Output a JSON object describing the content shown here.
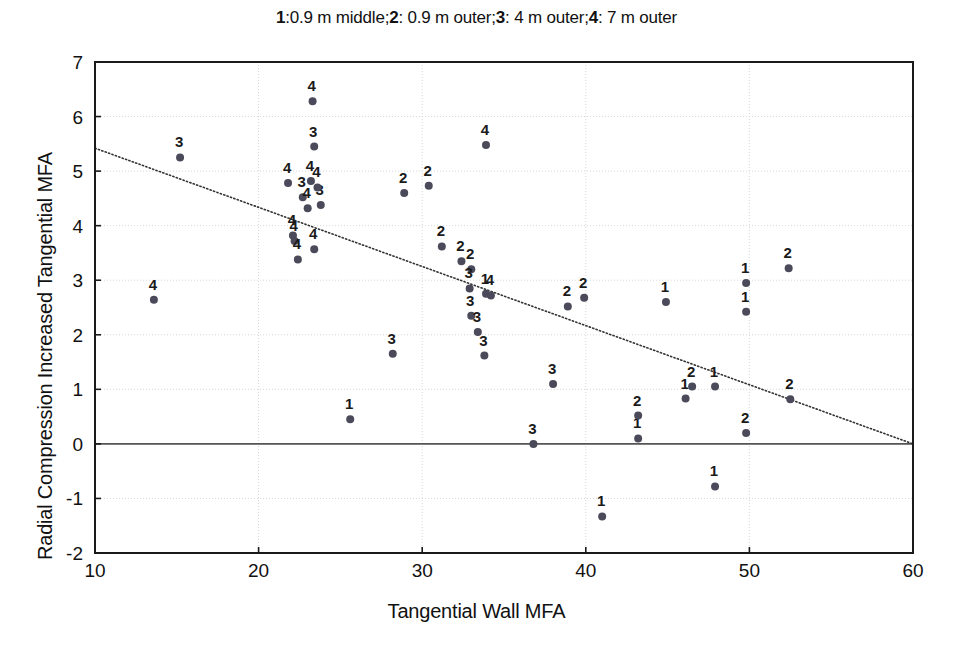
{
  "chart_data": {
    "type": "scatter",
    "title": "1:0.9 m middle;2: 0.9 m outer;3: 4 m outer;4: 7 m outer",
    "title_parts": [
      {
        "text": "1",
        "bold": true
      },
      {
        "text": ":0.9 m middle;",
        "bold": false
      },
      {
        "text": "2",
        "bold": true
      },
      {
        "text": ": 0.9 m outer;",
        "bold": false
      },
      {
        "text": "3",
        "bold": true
      },
      {
        "text": ": 4 m outer;",
        "bold": false
      },
      {
        "text": "4",
        "bold": true
      },
      {
        "text": ": 7 m outer",
        "bold": false
      }
    ],
    "xlabel": "Tangential Wall MFA",
    "ylabel": "Radial Compression Increased Tangential MFA",
    "xlim": [
      10,
      60
    ],
    "ylim": [
      -2,
      7
    ],
    "xticks": [
      10,
      20,
      30,
      40,
      50,
      60
    ],
    "yticks": [
      -2,
      -1,
      0,
      1,
      2,
      3,
      4,
      5,
      6,
      7
    ],
    "grid": true,
    "grid_style": "dotted-light",
    "legend": "none",
    "marker_color": "#4a4a5a",
    "marker_size": 4,
    "label_position": "above-left",
    "zero_line": {
      "y": 0,
      "color": "#555555",
      "width": 1.6
    },
    "trend_line": {
      "style": "dotted",
      "color": "#333333",
      "x0": 10,
      "y0": 5.42,
      "x1": 60,
      "y1": 0.0
    },
    "series": [
      {
        "name": "1",
        "label": "1: 0.9 m middle",
        "points": [
          {
            "x": 25.6,
            "y": 0.45
          },
          {
            "x": 33.9,
            "y": 2.75
          },
          {
            "x": 41.0,
            "y": -1.33
          },
          {
            "x": 43.2,
            "y": 0.1
          },
          {
            "x": 44.9,
            "y": 2.6
          },
          {
            "x": 46.1,
            "y": 0.83
          },
          {
            "x": 47.9,
            "y": 1.05
          },
          {
            "x": 47.9,
            "y": -0.78
          },
          {
            "x": 49.8,
            "y": 2.95
          },
          {
            "x": 49.8,
            "y": 2.42
          }
        ]
      },
      {
        "name": "2",
        "label": "2: 0.9 m outer",
        "points": [
          {
            "x": 28.9,
            "y": 4.6
          },
          {
            "x": 30.4,
            "y": 4.73
          },
          {
            "x": 31.2,
            "y": 3.62
          },
          {
            "x": 32.4,
            "y": 3.35
          },
          {
            "x": 33.0,
            "y": 3.2
          },
          {
            "x": 38.9,
            "y": 2.52
          },
          {
            "x": 39.9,
            "y": 2.68
          },
          {
            "x": 43.2,
            "y": 0.52
          },
          {
            "x": 46.5,
            "y": 1.05
          },
          {
            "x": 49.8,
            "y": 0.2
          },
          {
            "x": 52.4,
            "y": 3.22
          },
          {
            "x": 52.5,
            "y": 0.82
          }
        ]
      },
      {
        "name": "3",
        "label": "3: 4 m outer",
        "points": [
          {
            "x": 15.2,
            "y": 5.25
          },
          {
            "x": 22.7,
            "y": 4.52
          },
          {
            "x": 23.4,
            "y": 5.45
          },
          {
            "x": 23.8,
            "y": 4.38
          },
          {
            "x": 28.2,
            "y": 1.65
          },
          {
            "x": 32.9,
            "y": 2.85
          },
          {
            "x": 33.0,
            "y": 2.35
          },
          {
            "x": 33.4,
            "y": 2.05
          },
          {
            "x": 33.8,
            "y": 1.62
          },
          {
            "x": 36.8,
            "y": 0.0
          },
          {
            "x": 38.0,
            "y": 1.1
          }
        ]
      },
      {
        "name": "4",
        "label": "4: 7 m outer",
        "points": [
          {
            "x": 13.6,
            "y": 2.64
          },
          {
            "x": 21.8,
            "y": 4.78
          },
          {
            "x": 22.1,
            "y": 3.82
          },
          {
            "x": 22.2,
            "y": 3.72
          },
          {
            "x": 22.4,
            "y": 3.38
          },
          {
            "x": 23.3,
            "y": 6.28
          },
          {
            "x": 23.2,
            "y": 4.82
          },
          {
            "x": 23.0,
            "y": 4.32
          },
          {
            "x": 23.4,
            "y": 3.57
          },
          {
            "x": 23.6,
            "y": 4.7
          },
          {
            "x": 33.9,
            "y": 5.48
          },
          {
            "x": 34.2,
            "y": 2.72
          }
        ]
      }
    ]
  },
  "axes": {
    "x_tick_labels": [
      "10",
      "20",
      "30",
      "40",
      "50",
      "60"
    ],
    "y_tick_labels": [
      "-2",
      "-1",
      "0",
      "1",
      "2",
      "3",
      "4",
      "5",
      "6",
      "7"
    ],
    "x_title": "Tangential Wall MFA",
    "y_title": "Radial Compression Increased Tangential MFA"
  }
}
